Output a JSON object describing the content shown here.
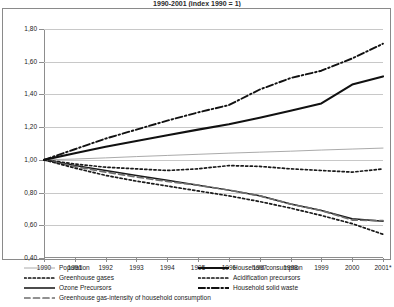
{
  "figure": {
    "title_partial": "1990-2001  (index 1990 = 1)"
  },
  "chart_data": {
    "type": "line",
    "title": "1990-2001  (index 1990 = 1)",
    "xlabel": "",
    "ylabel": "",
    "grid": true,
    "legend_position": "bottom",
    "ylim": [
      0.4,
      1.8
    ],
    "ytick_labels": [
      "1,80",
      "1,60",
      "1,40",
      "1,20",
      "1,00",
      "0,80",
      "0,60",
      "0,40"
    ],
    "ytick_values": [
      1.8,
      1.6,
      1.4,
      1.2,
      1.0,
      0.8,
      0.6,
      0.4
    ],
    "categories": [
      "1990",
      "1991",
      "1992",
      "1993",
      "1994",
      "1995",
      "1996",
      "1997",
      "1998",
      "1999",
      "2000",
      "2001*"
    ],
    "x": [
      1990,
      1991,
      1992,
      1993,
      1994,
      1995,
      1996,
      1997,
      1998,
      1999,
      2000,
      2001
    ],
    "series": [
      {
        "name": "Population",
        "style": "thin-solid-gray",
        "color": "#a0a0a0",
        "values": [
          1.0,
          1.005,
          1.012,
          1.02,
          1.027,
          1.034,
          1.041,
          1.047,
          1.053,
          1.06,
          1.066,
          1.072
        ]
      },
      {
        "name": "Greenhouse gases",
        "style": "dotted",
        "color": "#1a1a1a",
        "values": [
          1.0,
          0.975,
          0.955,
          0.945,
          0.935,
          0.945,
          0.965,
          0.96,
          0.945,
          0.935,
          0.925,
          0.945
        ]
      },
      {
        "name": "Ozone Precursors",
        "style": "solid",
        "color": "#1a1a1a",
        "values": [
          1.0,
          0.965,
          0.935,
          0.905,
          0.875,
          0.845,
          0.815,
          0.78,
          0.73,
          0.69,
          0.64,
          0.625
        ]
      },
      {
        "name": "Greenhouse gas-intensity of household consumption",
        "style": "dashed",
        "color": "#6e6e6e",
        "values": [
          1.0,
          0.96,
          0.925,
          0.895,
          0.868,
          0.845,
          0.815,
          0.78,
          0.73,
          0.69,
          0.632,
          0.628
        ]
      },
      {
        "name": "Household consumption",
        "style": "bold-solid",
        "color": "#111111",
        "values": [
          1.0,
          1.04,
          1.08,
          1.115,
          1.15,
          1.185,
          1.218,
          1.258,
          1.3,
          1.345,
          1.46,
          1.51
        ]
      },
      {
        "name": "Acidification precursors",
        "style": "dotted",
        "color": "#1a1a1a",
        "values": [
          1.0,
          0.95,
          0.905,
          0.87,
          0.84,
          0.81,
          0.78,
          0.745,
          0.705,
          0.66,
          0.61,
          0.545
        ]
      },
      {
        "name": "Household solid waste",
        "style": "dash-dot",
        "color": "#111111",
        "values": [
          1.0,
          1.065,
          1.13,
          1.185,
          1.24,
          1.29,
          1.335,
          1.43,
          1.5,
          1.545,
          1.62,
          1.71
        ]
      }
    ]
  },
  "legend": {
    "left": [
      {
        "label": "Population",
        "style": "thin-solid-gray"
      },
      {
        "label": "Greenhouse gases",
        "style": "dotted"
      },
      {
        "label": "Ozone Precursors",
        "style": "solid"
      },
      {
        "label": "Greenhouse gas-intensity of household consumption",
        "style": "dashed"
      }
    ],
    "right": [
      {
        "label": "Household consumption",
        "style": "bold-solid"
      },
      {
        "label": "Acidification precursors",
        "style": "dotted"
      },
      {
        "label": "Household solid waste",
        "style": "dash-dot"
      }
    ]
  }
}
